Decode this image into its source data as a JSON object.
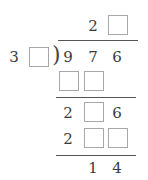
{
  "problem": {
    "type": "long-division-fill-in-blanks",
    "quotient": {
      "digits": [
        "2",
        ""
      ]
    },
    "divisor": {
      "digits": [
        "3",
        ""
      ]
    },
    "dividend": {
      "digits": [
        "9",
        "7",
        "6"
      ]
    },
    "step1_product": {
      "digits": [
        "",
        ""
      ]
    },
    "step2_remainder_row": {
      "digits": [
        "2",
        "",
        "6"
      ]
    },
    "step2_product": {
      "digits": [
        "2",
        "",
        ""
      ]
    },
    "final_remainder": {
      "digits": [
        "1",
        "4"
      ]
    },
    "symbols": {
      "division_bracket": ")"
    }
  },
  "colors": {
    "text": "#3a3a3a",
    "box_border": "#a8a8a8",
    "rule": "#555555"
  }
}
